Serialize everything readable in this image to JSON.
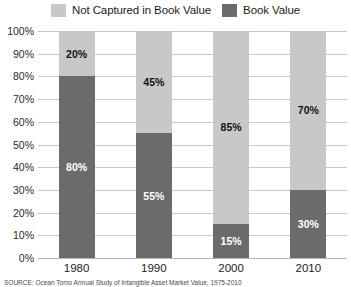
{
  "legend": {
    "position": "top-center",
    "items": [
      {
        "label": "Not Captured in Book Value",
        "color": "#c8c8c8",
        "swatch_name": "legend-swatch-not-captured"
      },
      {
        "label": "Book Value",
        "color": "#6b6b6b",
        "swatch_name": "legend-swatch-book-value"
      }
    ]
  },
  "footnote": {
    "text": "SOURCE: Ocean Tomo Annual Study of Intangible Asset Market Value, 1975-2010"
  },
  "chart_data": {
    "type": "bar",
    "stacked": true,
    "title": "",
    "subtitle": "",
    "xlabel": "",
    "ylabel": "",
    "categories": [
      "1980",
      "1990",
      "2000",
      "2010"
    ],
    "ylim": [
      0,
      100
    ],
    "yticks": [
      0,
      10,
      20,
      30,
      40,
      50,
      60,
      70,
      80,
      90,
      100
    ],
    "ytick_labels": [
      "0%",
      "10%",
      "20%",
      "30%",
      "40%",
      "50%",
      "60%",
      "70%",
      "80%",
      "90%",
      "100%"
    ],
    "grid": true,
    "legend_position": "top",
    "series": [
      {
        "name": "Not Captured in Book Value",
        "color": "#c8c8c8",
        "values": [
          20,
          45,
          85,
          70
        ],
        "labels": [
          "20%",
          "45%",
          "85%",
          "70%"
        ],
        "label_color": "#111111"
      },
      {
        "name": "Book Value",
        "color": "#6b6b6b",
        "values": [
          80,
          55,
          15,
          30
        ],
        "labels": [
          "80%",
          "55%",
          "15%",
          "30%"
        ],
        "label_color": "#ffffff"
      }
    ]
  }
}
